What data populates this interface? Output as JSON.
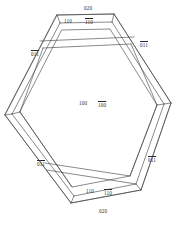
{
  "figure": {
    "type": "crystal-habit-diagram",
    "line_color": "#3a3a3a",
    "fill_color": "#ffffff",
    "background": "#ffffff",
    "text_color": "#2a2a2a"
  },
  "labels": [
    {
      "id": "top-020",
      "name": "face-label-020-top",
      "h": "0",
      "k": "2",
      "l": "0",
      "bar_h": false,
      "bar_k": false,
      "bar_l": false,
      "text": "020",
      "x": 84,
      "y": 6
    },
    {
      "id": "top-110",
      "name": "face-label-110-top",
      "h": "1",
      "k": "1",
      "l": "0",
      "bar_h": false,
      "bar_k": false,
      "bar_l": false,
      "text": "110",
      "x": 64,
      "y": 19
    },
    {
      "id": "top-1bar10",
      "name": "face-label-1bar10-top",
      "h": "1",
      "k": "1",
      "l": "0",
      "bar_h": true,
      "bar_k": false,
      "bar_l": false,
      "text": "110",
      "x": 85,
      "y": 20
    },
    {
      "id": "right-01bar1bar",
      "name": "face-label-01bar1bar-right",
      "h": "0",
      "k": "1",
      "l": "1",
      "bar_h": false,
      "bar_k": true,
      "bar_l": true,
      "text": "011",
      "x": 140,
      "y": 43
    },
    {
      "id": "left-01bar1",
      "name": "face-label-01bar1-left",
      "h": "0",
      "k": "1",
      "l": "1",
      "bar_h": false,
      "bar_k": true,
      "bar_l": false,
      "text": "011",
      "x": 31,
      "y": 52
    },
    {
      "id": "center-100",
      "name": "face-label-100-center",
      "h": "1",
      "k": "0",
      "l": "0",
      "bar_h": false,
      "bar_k": false,
      "bar_l": false,
      "text": "100",
      "x": 79,
      "y": 101
    },
    {
      "id": "center-1bar00",
      "name": "face-label-1bar00-center",
      "h": "1",
      "k": "0",
      "l": "0",
      "bar_h": true,
      "bar_k": false,
      "bar_l": false,
      "text": "100",
      "x": 98,
      "y": 103
    },
    {
      "id": "left-01bar1b",
      "name": "face-label-01bar1-lower-left",
      "h": "0",
      "k": "1",
      "l": "1",
      "bar_h": false,
      "bar_k": true,
      "bar_l": false,
      "text": "011",
      "x": 37,
      "y": 162
    },
    {
      "id": "right-01bar1b",
      "name": "face-label-01bar1-lower-right",
      "h": "0",
      "k": "1",
      "l": "1",
      "bar_h": false,
      "bar_k": true,
      "bar_l": true,
      "text": "011",
      "x": 148,
      "y": 158
    },
    {
      "id": "bot-110",
      "name": "face-label-110-bottom",
      "h": "1",
      "k": "1",
      "l": "0",
      "bar_h": false,
      "bar_k": false,
      "bar_l": false,
      "text": "110",
      "x": 86,
      "y": 189
    },
    {
      "id": "bot-1bar10",
      "name": "face-label-1bar10-bottom",
      "h": "1",
      "k": "1",
      "l": "0",
      "bar_h": true,
      "bar_k": false,
      "bar_l": false,
      "text": "110",
      "x": 104,
      "y": 191
    },
    {
      "id": "bot-020",
      "name": "face-label-020-bottom",
      "h": "0",
      "k": "2",
      "l": "0",
      "bar_h": false,
      "bar_k": false,
      "bar_l": false,
      "text": "020",
      "x": 99,
      "y": 209
    }
  ],
  "geometry": {
    "outer_hexagon": "M 57,15 L 114,14 L 171,103 L 141,190 L 71,203 L 5,115 Z",
    "inner_hexagon": "M 59,22 L 112,21 L 156,103 L 131,178 L 70,190 L 17,113 Z"
  }
}
